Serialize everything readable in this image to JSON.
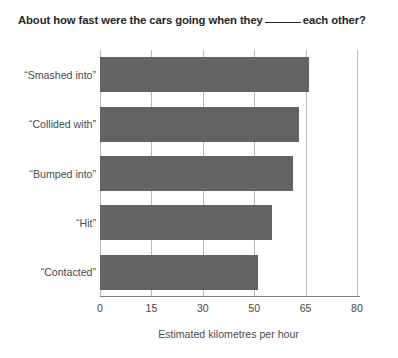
{
  "chart_data": {
    "type": "bar",
    "orientation": "horizontal",
    "title_parts": {
      "before_blank": "About how fast were the cars going when they",
      "after_blank": "each other?"
    },
    "xlabel": "Estimated kilometres per hour",
    "ylabel": "",
    "categories": [
      "“Smashed into”",
      "“Collided with”",
      "“Bumped into”",
      "“Hit”",
      "“Contacted”"
    ],
    "values": [
      66.0,
      63.2,
      61.3,
      55.1,
      51.0
    ],
    "value_labels": [
      "66.0",
      "63.2",
      "61.3",
      "55.1",
      "51.0"
    ],
    "xticks": [
      0,
      15,
      30,
      50,
      65,
      80
    ],
    "xtick_labels": [
      "0",
      "15",
      "30",
      "50",
      "65",
      "80"
    ],
    "xlim": [
      0,
      80
    ],
    "grid": true,
    "legend": false,
    "bar_color": "#636363",
    "gridline_color": "#b7b7b7",
    "axis_color": "#7a7a7a",
    "text_color": "#4a4a4a",
    "title_color": "#262626",
    "background": "#ffffff"
  }
}
